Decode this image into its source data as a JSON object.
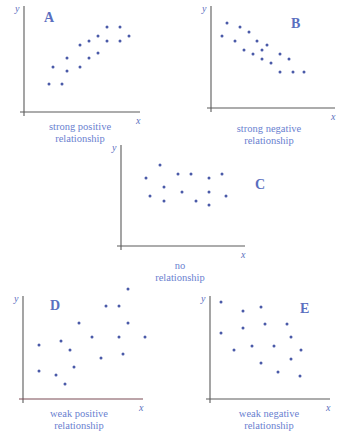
{
  "colors": {
    "dot": "#4a5aa8",
    "label": "#5a6fc0",
    "caption": "#6a7fd0",
    "axis": "#5a5a5a"
  },
  "chart_data": [
    {
      "type": "scatter",
      "panel": "A",
      "title": "A",
      "caption_line1": "strong positive",
      "caption_line2": "relationship",
      "xlabel": "x",
      "ylabel": "y",
      "grid": false,
      "axes": {
        "origin": [
          24,
          112
        ],
        "x_end": 140,
        "y_top": 6
      },
      "label_pos": [
        44,
        22
      ],
      "caption_pos": [
        20,
        121
      ],
      "points": [
        [
          49,
          84
        ],
        [
          62,
          84
        ],
        [
          53,
          67
        ],
        [
          67,
          71
        ],
        [
          67,
          58
        ],
        [
          80,
          67
        ],
        [
          80,
          45
        ],
        [
          89,
          58
        ],
        [
          89,
          41
        ],
        [
          98,
          53
        ],
        [
          98,
          36
        ],
        [
          107,
          41
        ],
        [
          107,
          27
        ],
        [
          120,
          41
        ],
        [
          120,
          27
        ],
        [
          129,
          36
        ]
      ]
    },
    {
      "type": "scatter",
      "panel": "B",
      "title": "B",
      "caption_line1": "strong negative",
      "caption_line2": "relationship",
      "xlabel": "x",
      "ylabel": "y",
      "grid": false,
      "axes": {
        "origin": [
          211,
          108
        ],
        "x_end": 335,
        "y_top": 6
      },
      "label_pos": [
        291,
        28
      ],
      "caption_pos": [
        209,
        123
      ],
      "points": [
        [
          222,
          36
        ],
        [
          227,
          23
        ],
        [
          235,
          41
        ],
        [
          240,
          27
        ],
        [
          244,
          50
        ],
        [
          249,
          32
        ],
        [
          253,
          54
        ],
        [
          257,
          41
        ],
        [
          262,
          50
        ],
        [
          262,
          59
        ],
        [
          267,
          45
        ],
        [
          271,
          63
        ],
        [
          280,
          54
        ],
        [
          280,
          72
        ],
        [
          289,
          59
        ],
        [
          293,
          72
        ],
        [
          304,
          72
        ]
      ]
    },
    {
      "type": "scatter",
      "panel": "C",
      "title": "C",
      "caption_line1": "no",
      "caption_line2": "relationship",
      "xlabel": "x",
      "ylabel": "y",
      "grid": false,
      "axes": {
        "origin": [
          121,
          246
        ],
        "x_end": 245,
        "y_top": 145
      },
      "label_pos": [
        255,
        189
      ],
      "caption_pos": [
        120,
        260
      ],
      "points": [
        [
          146,
          178
        ],
        [
          150,
          196
        ],
        [
          160,
          165
        ],
        [
          164,
          187
        ],
        [
          164,
          201
        ],
        [
          178,
          174
        ],
        [
          182,
          192
        ],
        [
          191,
          174
        ],
        [
          196,
          201
        ],
        [
          209,
          178
        ],
        [
          209,
          192
        ],
        [
          209,
          205
        ],
        [
          222,
          174
        ],
        [
          226,
          196
        ]
      ]
    },
    {
      "type": "scatter",
      "panel": "D",
      "title": "D",
      "caption_line1": "weak positive",
      "caption_line2": "relationship",
      "xlabel": "x",
      "ylabel": "y",
      "grid": false,
      "axes": {
        "origin": [
          23,
          399
        ],
        "x_end": 143,
        "y_top": 296
      },
      "label_pos": [
        50,
        310
      ],
      "caption_pos": [
        19,
        408
      ],
      "points": [
        [
          39,
          345
        ],
        [
          39,
          371
        ],
        [
          56,
          375
        ],
        [
          61,
          341
        ],
        [
          65,
          384
        ],
        [
          70,
          350
        ],
        [
          74,
          367
        ],
        [
          79,
          323
        ],
        [
          92,
          337
        ],
        [
          101,
          358
        ],
        [
          106,
          306
        ],
        [
          119,
          306
        ],
        [
          119,
          337
        ],
        [
          123,
          354
        ],
        [
          128,
          323
        ],
        [
          128,
          289
        ],
        [
          145,
          337
        ]
      ]
    },
    {
      "type": "scatter",
      "panel": "E",
      "title": "E",
      "caption_line1": "weak negative",
      "caption_line2": "relationship",
      "xlabel": "x",
      "ylabel": "y",
      "grid": false,
      "axes": {
        "origin": [
          210,
          399
        ],
        "x_end": 330,
        "y_top": 296
      },
      "label_pos": [
        300,
        313
      ],
      "caption_pos": [
        209,
        408
      ],
      "points": [
        [
          221,
          302
        ],
        [
          221,
          333
        ],
        [
          234,
          350
        ],
        [
          243,
          311
        ],
        [
          243,
          328
        ],
        [
          252,
          346
        ],
        [
          261,
          307
        ],
        [
          261,
          363
        ],
        [
          265,
          324
        ],
        [
          274,
          346
        ],
        [
          278,
          372
        ],
        [
          287,
          324
        ],
        [
          291,
          337
        ],
        [
          291,
          359
        ],
        [
          301,
          350
        ],
        [
          300,
          376
        ]
      ]
    }
  ]
}
